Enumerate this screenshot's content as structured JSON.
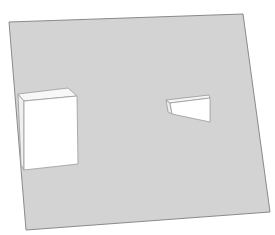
{
  "scene": {
    "width": 275,
    "height": 235,
    "background": "#ffffff",
    "plane": {
      "fill": "#d3d3d3",
      "stroke": "#8a8a8a",
      "points": "9,22 243,14 270,212 26,230"
    },
    "objects": [
      {
        "name": "tall-box",
        "faces": [
          {
            "name": "left-side",
            "fill": "#efefef",
            "stroke": "#9a9a9a",
            "points": "18,94 24,101 24,170 21,165"
          },
          {
            "name": "top",
            "fill": "#f7f7f7",
            "stroke": "#9a9a9a",
            "points": "18,94 68,88 77,96 24,101"
          },
          {
            "name": "front",
            "fill": "#ffffff",
            "stroke": "#9a9a9a",
            "points": "24,101 77,96 78,164 24,170"
          }
        ]
      },
      {
        "name": "wedge-block",
        "faces": [
          {
            "name": "left-side",
            "fill": "#ececec",
            "stroke": "#9a9a9a",
            "points": "166,100 170,103 172,114 168,112"
          },
          {
            "name": "top",
            "fill": "#f5f5f5",
            "stroke": "#9a9a9a",
            "points": "166,100 209,95 210,98 170,103"
          },
          {
            "name": "front",
            "fill": "#ffffff",
            "stroke": "#9a9a9a",
            "points": "170,103 210,98 210,122 172,114"
          }
        ]
      }
    ]
  }
}
